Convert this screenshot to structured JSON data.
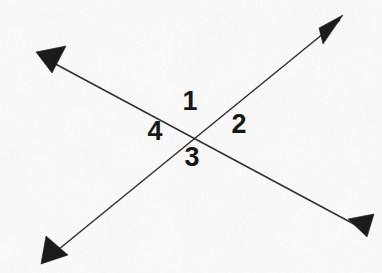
{
  "figure": {
    "background_color": "#fbfbfb",
    "line_color": "#2b2b2b",
    "arrow_color": "#151515",
    "label_color": "#111111",
    "width": 382,
    "height": 273,
    "intersection": {
      "x": 197,
      "y": 131
    }
  },
  "lines": [
    {
      "id": "line-a",
      "name": "descending-line",
      "description": "Line running from upper-left to lower-right",
      "start": {
        "x": 48,
        "y": 60
      },
      "end": {
        "x": 365,
        "y": 230
      },
      "arrow_start": true,
      "arrow_end": true
    },
    {
      "id": "line-b",
      "name": "ascending-line",
      "description": "Line running from lower-left to upper-right",
      "start": {
        "x": 48,
        "y": 258
      },
      "end": {
        "x": 340,
        "y": 20
      },
      "arrow_start": true,
      "arrow_end": true
    }
  ],
  "arrowheads": [
    {
      "id": "arrow-top-left",
      "name": "arrowhead-top-left",
      "direction": "down-left",
      "tip": {
        "x": 48,
        "y": 60
      }
    },
    {
      "id": "arrow-bottom-right",
      "name": "arrowhead-bottom-right",
      "direction": "down-right",
      "tip": {
        "x": 365,
        "y": 230
      }
    },
    {
      "id": "arrow-bottom-left",
      "name": "arrowhead-bottom-left",
      "direction": "down-left",
      "tip": {
        "x": 48,
        "y": 258
      }
    },
    {
      "id": "arrow-top-right",
      "name": "arrowhead-top-right",
      "direction": "up-right",
      "tip": {
        "x": 340,
        "y": 20
      }
    }
  ],
  "labels": [
    {
      "id": "label-1",
      "text": "1",
      "position": "top",
      "x": 190,
      "y": 103
    },
    {
      "id": "label-2",
      "text": "2",
      "position": "right",
      "x": 239,
      "y": 126
    },
    {
      "id": "label-3",
      "text": "3",
      "position": "bottom",
      "x": 192,
      "y": 159
    },
    {
      "id": "label-4",
      "text": "4",
      "position": "left",
      "x": 155,
      "y": 133
    }
  ]
}
